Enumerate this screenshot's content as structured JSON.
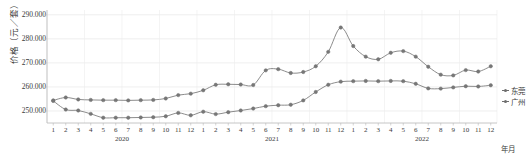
{
  "axes": {
    "y_title": "价格（元／套）",
    "y_ticks": [
      "250.000",
      "260.000",
      "270.000",
      "280.000",
      "290.000"
    ],
    "y_tick_values": [
      250000,
      260000,
      270000,
      280000,
      290000
    ],
    "x_axis_name": "年月",
    "years": [
      "2020",
      "2021",
      "2022"
    ],
    "months": [
      "1",
      "2",
      "3",
      "4",
      "5",
      "6",
      "7",
      "8",
      "9",
      "10",
      "11",
      "12"
    ]
  },
  "legend": {
    "items": [
      {
        "label": "东莞",
        "color": "#6e6e6e"
      },
      {
        "label": "广州",
        "color": "#6e6e6e"
      }
    ]
  },
  "chart_data": {
    "type": "line",
    "title": "",
    "xlabel": "年月",
    "ylabel": "价格（元／套）",
    "ylim": [
      245000,
      292000
    ],
    "grid": true,
    "legend_position": "right",
    "categories": [
      "2020-1",
      "2020-2",
      "2020-3",
      "2020-4",
      "2020-5",
      "2020-6",
      "2020-7",
      "2020-8",
      "2020-9",
      "2020-10",
      "2020-11",
      "2020-12",
      "2021-1",
      "2021-2",
      "2021-3",
      "2021-4",
      "2021-5",
      "2021-6",
      "2021-7",
      "2021-8",
      "2021-9",
      "2021-10",
      "2021-11",
      "2021-12",
      "2022-1",
      "2022-2",
      "2022-3",
      "2022-4",
      "2022-5",
      "2022-6",
      "2022-7",
      "2022-8",
      "2022-9",
      "2022-10",
      "2022-11",
      "2022-12"
    ],
    "series": [
      {
        "name": "东莞",
        "color": "#6e6e6e",
        "values": [
          254400,
          255600,
          254800,
          254600,
          254500,
          254500,
          254400,
          254500,
          254600,
          255200,
          256600,
          257200,
          258600,
          260900,
          261100,
          261000,
          260800,
          266900,
          267400,
          265800,
          266200,
          268600,
          274600,
          284700,
          277000,
          272600,
          271500,
          274200,
          274900,
          272600,
          268400,
          265100,
          264800,
          267000,
          266400,
          268600
        ]
      },
      {
        "name": "广州",
        "color": "#6e6e6e",
        "values": [
          254200,
          250600,
          250200,
          248800,
          247200,
          247200,
          247200,
          247300,
          247400,
          247800,
          249200,
          248200,
          249700,
          248700,
          249500,
          250200,
          251000,
          252000,
          252400,
          252600,
          254400,
          257900,
          260900,
          262200,
          262400,
          262500,
          262400,
          262500,
          262400,
          261300,
          259400,
          259300,
          259800,
          260300,
          260200,
          260700
        ]
      }
    ]
  }
}
